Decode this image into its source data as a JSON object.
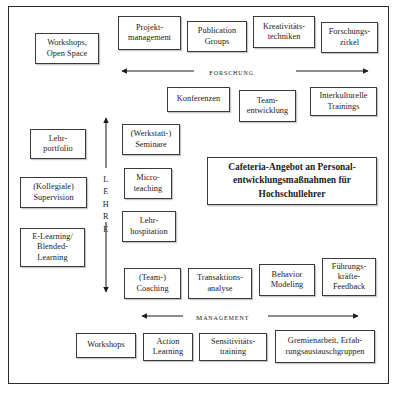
{
  "diagram": {
    "center_box": {
      "label": "Cafeteria-Angebot an Personal-\nentwicklungsmaßnahmen für\nHochschullehrer"
    },
    "axes": [
      {
        "name": "forschung-axis",
        "label": "FORSCHUNG",
        "orientation": "horizontal",
        "arrows": "both"
      },
      {
        "name": "lehre-axis",
        "label": "LEHRE",
        "orientation": "vertical",
        "arrows": "both",
        "letters": [
          "L",
          "E",
          "H",
          "R",
          "E"
        ]
      },
      {
        "name": "management-axis",
        "label": "MANAGEMENT",
        "orientation": "horizontal",
        "arrows": "both"
      }
    ],
    "groups": {
      "forschung_top": [
        {
          "name": "box-projektmanagement",
          "label": "Projekt-\nmanagement"
        },
        {
          "name": "box-publication-groups",
          "label": "Publication\nGroups"
        },
        {
          "name": "box-kreativitaetstechniken",
          "label": "Kreativitäts-\ntechniken"
        },
        {
          "name": "box-forschungszirkel",
          "label": "Forschungs-\nzirkel"
        }
      ],
      "forschung_second": [
        {
          "name": "box-konferenzen",
          "label": "Konferenzen"
        },
        {
          "name": "box-teamentwicklung",
          "label": "Team-\nentwicklung"
        },
        {
          "name": "box-interkulturelle-trainings",
          "label": "Interkulturelle\nTrainings"
        }
      ],
      "left_column": [
        {
          "name": "box-workshops-open-space",
          "label": "Workshops,\nOpen Space"
        },
        {
          "name": "box-lehrportfolio",
          "label": "Lehr-\nportfolio"
        },
        {
          "name": "box-kollegiale-supervision",
          "label": "(Kollegiale)\nSupervision"
        },
        {
          "name": "box-elearning-blended-learning",
          "label": "E-Learning/\nBlended-\nLearning"
        }
      ],
      "lehre_column": [
        {
          "name": "box-werkstatt-seminare",
          "label": "(Werkstatt-)\nSeminare"
        },
        {
          "name": "box-microteaching",
          "label": "Micro-\nteaching"
        },
        {
          "name": "box-lehrhospitation",
          "label": "Lehr-\nhospitation"
        }
      ],
      "management_upper": [
        {
          "name": "box-team-coaching",
          "label": "(Team-)\nCoaching"
        },
        {
          "name": "box-transaktionsanalyse",
          "label": "Transaktions-\nanalyse"
        },
        {
          "name": "box-behavior-modeling",
          "label": "Behavior\nModeling"
        },
        {
          "name": "box-fuehrungskraefte-feedback",
          "label": "Führungs-\nkräfte-\nFeedback"
        }
      ],
      "management_lower": [
        {
          "name": "box-workshops",
          "label": "Workshops"
        },
        {
          "name": "box-action-learning",
          "label": "Action\nLearning"
        },
        {
          "name": "box-sensitivitaetstraining",
          "label": "Sensitivitäts-\ntraining"
        },
        {
          "name": "box-gremienarbeit",
          "label": "Gremienarbeit, Erfah-\nrungsaustauschgruppen"
        }
      ]
    },
    "colors": {
      "border": "#3a3a3a",
      "frame": "#2b2b2b",
      "text": "#1a1a1a",
      "background": "#ffffff",
      "shadow": "rgba(120,120,120,0.42)"
    }
  }
}
